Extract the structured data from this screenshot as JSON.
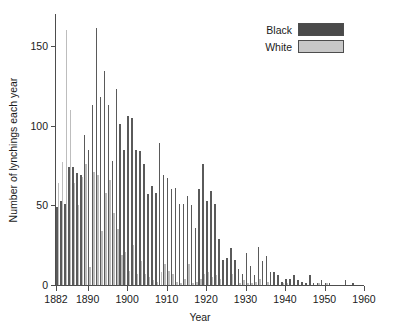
{
  "chart_data": {
    "type": "bar",
    "title": "",
    "xlabel": "Year",
    "ylabel": "Number of lynchings each year",
    "xlim": [
      1882,
      1960
    ],
    "ylim": [
      0,
      170
    ],
    "grid": false,
    "legend_position": "top-right",
    "xticks": [
      1882,
      1890,
      1900,
      1910,
      1920,
      1930,
      1940,
      1950,
      1960
    ],
    "yticks": [
      0,
      50,
      100,
      150
    ],
    "colors": {
      "Black": "#5a5a5a",
      "White": "#bdbdbd",
      "axis": "#4d4d4d"
    },
    "categories": [
      1882,
      1883,
      1884,
      1885,
      1886,
      1887,
      1888,
      1889,
      1890,
      1891,
      1892,
      1893,
      1894,
      1895,
      1896,
      1897,
      1898,
      1899,
      1900,
      1901,
      1902,
      1903,
      1904,
      1905,
      1906,
      1907,
      1908,
      1909,
      1910,
      1911,
      1912,
      1913,
      1914,
      1915,
      1916,
      1917,
      1918,
      1919,
      1920,
      1921,
      1922,
      1923,
      1924,
      1925,
      1926,
      1927,
      1928,
      1929,
      1930,
      1931,
      1932,
      1933,
      1934,
      1935,
      1936,
      1937,
      1938,
      1939,
      1940,
      1941,
      1942,
      1943,
      1944,
      1945,
      1946,
      1947,
      1948,
      1949,
      1950,
      1951,
      1952,
      1953,
      1954,
      1955,
      1956,
      1957,
      1958,
      1959,
      1960
    ],
    "series": [
      {
        "name": "Black",
        "color": "#5a5a5a",
        "values": [
          49,
          53,
          51,
          74,
          74,
          70,
          69,
          94,
          85,
          113,
          161,
          118,
          134,
          113,
          78,
          123,
          101,
          85,
          106,
          105,
          85,
          84,
          76,
          57,
          62,
          58,
          89,
          69,
          67,
          60,
          61,
          51,
          51,
          56,
          50,
          36,
          60,
          76,
          53,
          59,
          51,
          29,
          16,
          17,
          23,
          16,
          10,
          7,
          20,
          12,
          6,
          24,
          15,
          18,
          8,
          8,
          6,
          2,
          4,
          4,
          6,
          3,
          2,
          1,
          6,
          1,
          1,
          3,
          1,
          1,
          0,
          0,
          0,
          3,
          0,
          1,
          0,
          0,
          0
        ]
      },
      {
        "name": "White",
        "color": "#bdbdbd",
        "values": [
          64,
          77,
          160,
          110,
          64,
          50,
          68,
          76,
          11,
          71,
          69,
          34,
          58,
          66,
          45,
          35,
          19,
          21,
          9,
          25,
          7,
          15,
          7,
          5,
          3,
          2,
          8,
          13,
          9,
          7,
          2,
          1,
          4,
          13,
          1,
          2,
          4,
          7,
          8,
          5,
          6,
          4,
          0,
          0,
          7,
          0,
          1,
          3,
          1,
          1,
          2,
          4,
          0,
          2,
          0,
          0,
          0,
          1,
          1,
          0,
          0,
          0,
          0,
          0,
          0,
          0,
          1,
          0,
          1,
          0,
          0,
          0,
          0,
          0,
          0,
          0,
          0,
          0,
          0
        ]
      }
    ]
  },
  "legend": {
    "items": [
      {
        "label": "Black",
        "swatch_class": "sw-black"
      },
      {
        "label": "White",
        "swatch_class": "sw-white"
      }
    ]
  },
  "axes": {
    "x_title": "Year",
    "y_title": "Number of lynchings each year"
  }
}
